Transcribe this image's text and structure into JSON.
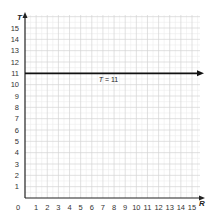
{
  "chart_data": {
    "type": "line",
    "title": "",
    "xlabel": "R",
    "ylabel": "T",
    "xlim": [
      0,
      15
    ],
    "ylim": [
      0,
      15
    ],
    "x_ticks": [
      "0",
      "1",
      "2",
      "3",
      "4",
      "5",
      "6",
      "7",
      "8",
      "9",
      "10",
      "11",
      "12",
      "13",
      "14",
      "15"
    ],
    "y_ticks": [
      "1",
      "2",
      "3",
      "4",
      "5",
      "6",
      "7",
      "8",
      "9",
      "10",
      "11",
      "12",
      "13",
      "14",
      "15"
    ],
    "grid": true,
    "minor_grid": true,
    "series": [
      {
        "name": "T = 11",
        "kind": "horizontal-line",
        "x": [
          0,
          15.5
        ],
        "y": [
          11,
          11
        ],
        "arrow": "right"
      }
    ],
    "annotations": [
      {
        "text_var": "T",
        "text_rest": " = 11",
        "x": 7.5,
        "y": 11,
        "position": "below"
      }
    ],
    "colors": {
      "line": "#111111",
      "axis": "#222222",
      "grid_major": "#d4d4d4",
      "grid_minor": "#ececec"
    }
  }
}
